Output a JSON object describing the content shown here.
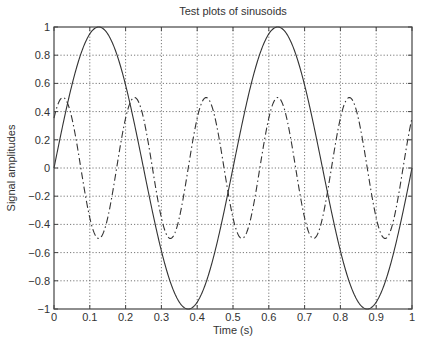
{
  "chart_data": {
    "type": "line",
    "title": "Test plots of sinusoids",
    "xlabel": "Time (s)",
    "ylabel": "Signal amplitudes",
    "xlim": [
      0,
      1
    ],
    "ylim": [
      -1,
      1
    ],
    "grid": true,
    "grid_style": "dotted",
    "legend": null,
    "xticks": [
      0,
      0.1,
      0.2,
      0.3,
      0.4,
      0.5,
      0.6,
      0.7,
      0.8,
      0.9,
      1
    ],
    "xtick_labels": [
      "0",
      "0.1",
      "0.2",
      "0.3",
      "0.4",
      "0.5",
      "0.6",
      "0.7",
      "0.8",
      "0.9",
      "1"
    ],
    "yticks": [
      1,
      0.8,
      0.6,
      0.4,
      0.2,
      0,
      -0.2,
      -0.4,
      -0.6,
      -0.8,
      -1
    ],
    "ytick_labels": [
      "1",
      "0.8",
      "0.6",
      "0.4",
      "0.2",
      "0",
      "−0.2",
      "−0.4",
      "−0.6",
      "−0.8",
      "−1"
    ],
    "series": [
      {
        "name": "sinusoid 2 Hz",
        "style": "solid",
        "color": "#333333",
        "amplitude": 1.0,
        "frequency_hz": 2,
        "phase_rad": 0,
        "formula": "sin(2*pi*2*t)",
        "x": [
          0,
          0.0625,
          0.125,
          0.1875,
          0.25,
          0.3125,
          0.375,
          0.4375,
          0.5,
          0.5625,
          0.625,
          0.6875,
          0.75,
          0.8125,
          0.875,
          0.9375,
          1
        ],
        "values": [
          0,
          0.707,
          1,
          0.707,
          0,
          -0.707,
          -1,
          -0.707,
          0,
          0.707,
          1,
          0.707,
          0,
          -0.707,
          -1,
          -0.707,
          0
        ]
      },
      {
        "name": "sinusoid 5 Hz",
        "style": "dashdot",
        "color": "#333333",
        "amplitude": 0.5,
        "frequency_hz": 5,
        "phase_rad": 0.7854,
        "formula": "0.5*sin(2*pi*5*t + pi/4)",
        "x": [
          0,
          0.025,
          0.075,
          0.125,
          0.175,
          0.225,
          0.275,
          0.325,
          0.375,
          0.425,
          0.475,
          0.525,
          0.575,
          0.625,
          0.675,
          0.725,
          0.775,
          0.825,
          0.875,
          0.925,
          0.975,
          1
        ],
        "values": [
          0.354,
          0.5,
          0,
          -0.5,
          0,
          0.5,
          0,
          -0.5,
          0,
          0.5,
          0,
          -0.5,
          0,
          0.5,
          0,
          -0.5,
          0,
          0.5,
          0,
          -0.5,
          0,
          0.354
        ]
      }
    ],
    "plot_area_px": {
      "left": 54,
      "top": 27,
      "right": 412,
      "bottom": 309
    }
  }
}
